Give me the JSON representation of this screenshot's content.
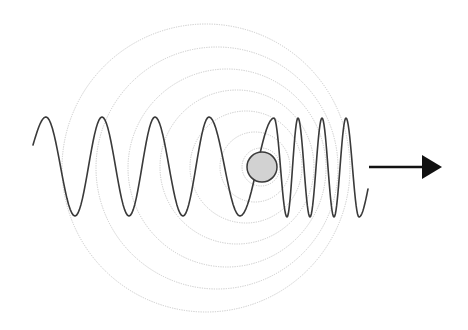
{
  "diagram": {
    "title": "Doppler effect: moving wave source",
    "colors": {
      "background": "#ffffff",
      "wave_stroke": "#3a3a3a",
      "wavefront_stroke": "#c8c8c8",
      "source_fill": "#d2d2d2",
      "source_stroke": "#3a3a3a",
      "arrow": "#111111"
    },
    "source": {
      "label": "moving source",
      "cx": 262,
      "cy": 167,
      "r": 15
    },
    "direction_arrow": {
      "label": "direction of motion",
      "x1": 369,
      "x2": 442,
      "y": 167
    },
    "wavefronts": [
      {
        "cx": 206,
        "cy": 168,
        "r": 144
      },
      {
        "cx": 217,
        "cy": 168,
        "r": 121
      },
      {
        "cx": 227,
        "cy": 168,
        "r": 99
      },
      {
        "cx": 237,
        "cy": 167,
        "r": 77
      },
      {
        "cx": 246,
        "cy": 167,
        "r": 56
      },
      {
        "cx": 255,
        "cy": 167,
        "r": 35
      },
      {
        "cx": 261,
        "cy": 167,
        "r": 19
      }
    ],
    "wave": {
      "label": "emitted wave",
      "behind_source": "long wavelength (lower frequency)",
      "ahead_of_source": "short wavelength (higher frequency)",
      "crest_y": 117,
      "trough_y": 216,
      "behind_crests_x": [
        46,
        102,
        155,
        209
      ],
      "behind_troughs_x": [
        75,
        129,
        183,
        240
      ],
      "ahead_crests_x": [
        274,
        298,
        322,
        346
      ],
      "ahead_troughs_x": [
        287,
        310,
        334,
        359
      ],
      "start": [
        33,
        145
      ],
      "end": [
        368,
        189
      ]
    }
  }
}
